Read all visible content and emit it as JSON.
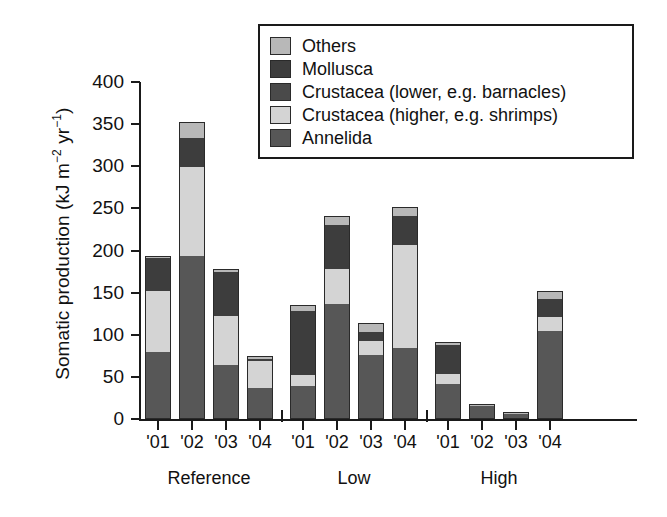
{
  "chart_data": {
    "type": "bar",
    "subtype": "stacked-bar",
    "title": "",
    "xlabel": "",
    "ylabel": "Somatic production (kJ m−2 yr−1)",
    "ylabel_parts": {
      "prefix": "Somatic production (kJ m",
      "exp1": "−2",
      "mid": " yr",
      "exp2": "−1",
      "suffix": ")"
    },
    "ylim": [
      0,
      400
    ],
    "yticks": [
      0,
      50,
      100,
      150,
      200,
      250,
      300,
      350,
      400
    ],
    "ytick_labels": [
      "0",
      "50",
      "100",
      "150",
      "200",
      "250",
      "300",
      "350",
      "400"
    ],
    "grid": false,
    "legend_position": "top-right",
    "categories": [
      "'01",
      "'02",
      "'03",
      "'04",
      "'01",
      "'02",
      "'03",
      "'04",
      "'01",
      "'02",
      "'03",
      "'04"
    ],
    "groups": [
      {
        "label": "Reference",
        "categories": [
          "'01",
          "'02",
          "'03",
          "'04"
        ]
      },
      {
        "label": "Low",
        "categories": [
          "'01",
          "'02",
          "'03",
          "'04"
        ]
      },
      {
        "label": "High",
        "categories": [
          "'01",
          "'02",
          "'03",
          "'04"
        ]
      }
    ],
    "series": [
      {
        "name": "Annelida",
        "color": "#575757",
        "values": [
          79,
          193,
          64,
          37,
          39,
          137,
          76,
          84,
          41,
          15,
          6,
          104
        ]
      },
      {
        "name": "Crustacea (higher, e.g. shrimps)",
        "color": "#d4d4d4",
        "values": [
          73,
          106,
          58,
          32,
          13,
          41,
          17,
          122,
          13,
          0,
          0,
          17
        ]
      },
      {
        "name": "Crustacea (lower, e.g. barnacles)",
        "color": "#4a4a4a",
        "values": [
          0,
          0,
          0,
          0,
          0,
          0,
          0,
          0,
          0,
          0,
          0,
          0
        ]
      },
      {
        "name": "Mollusca",
        "color": "#3d3d3d",
        "values": [
          39,
          35,
          52,
          2,
          76,
          52,
          10,
          35,
          34,
          0,
          0,
          22
        ]
      },
      {
        "name": "Others",
        "color": "#b8b8b8",
        "values": [
          2,
          19,
          4,
          4,
          7,
          11,
          11,
          11,
          4,
          1,
          1,
          9
        ]
      }
    ],
    "totals": [
      193,
      353,
      178,
      75,
      135,
      241,
      114,
      252,
      92,
      16,
      7,
      152
    ],
    "stack_order_bottom_to_top": [
      "Annelida",
      "Crustacea (higher, e.g. shrimps)",
      "Crustacea (lower, e.g. barnacles)",
      "Mollusca",
      "Others"
    ]
  },
  "legend": {
    "items": [
      {
        "label": "Others",
        "color": "#b8b8b8"
      },
      {
        "label": "Mollusca",
        "color": "#3d3d3d"
      },
      {
        "label": "Crustacea (lower, e.g. barnacles)",
        "color": "#4a4a4a"
      },
      {
        "label": "Crustacea (higher, e.g. shrimps)",
        "color": "#d4d4d4"
      },
      {
        "label": "Annelida",
        "color": "#575757"
      }
    ]
  },
  "axis_colors": {
    "line": "#1a1a1a",
    "text": "#111111",
    "background": "#ffffff"
  }
}
